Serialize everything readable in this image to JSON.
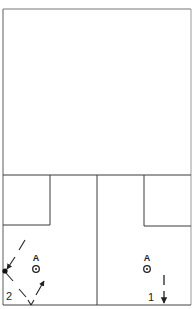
{
  "diagram": {
    "type": "basketball-half-court-play",
    "left_court": {
      "player_label": "A",
      "step_label": "2"
    },
    "right_court": {
      "player_label": "A",
      "step_label": "1"
    },
    "colors": {
      "line": "#3a3a3a",
      "frame": "#777777",
      "background": "#ffffff"
    }
  }
}
